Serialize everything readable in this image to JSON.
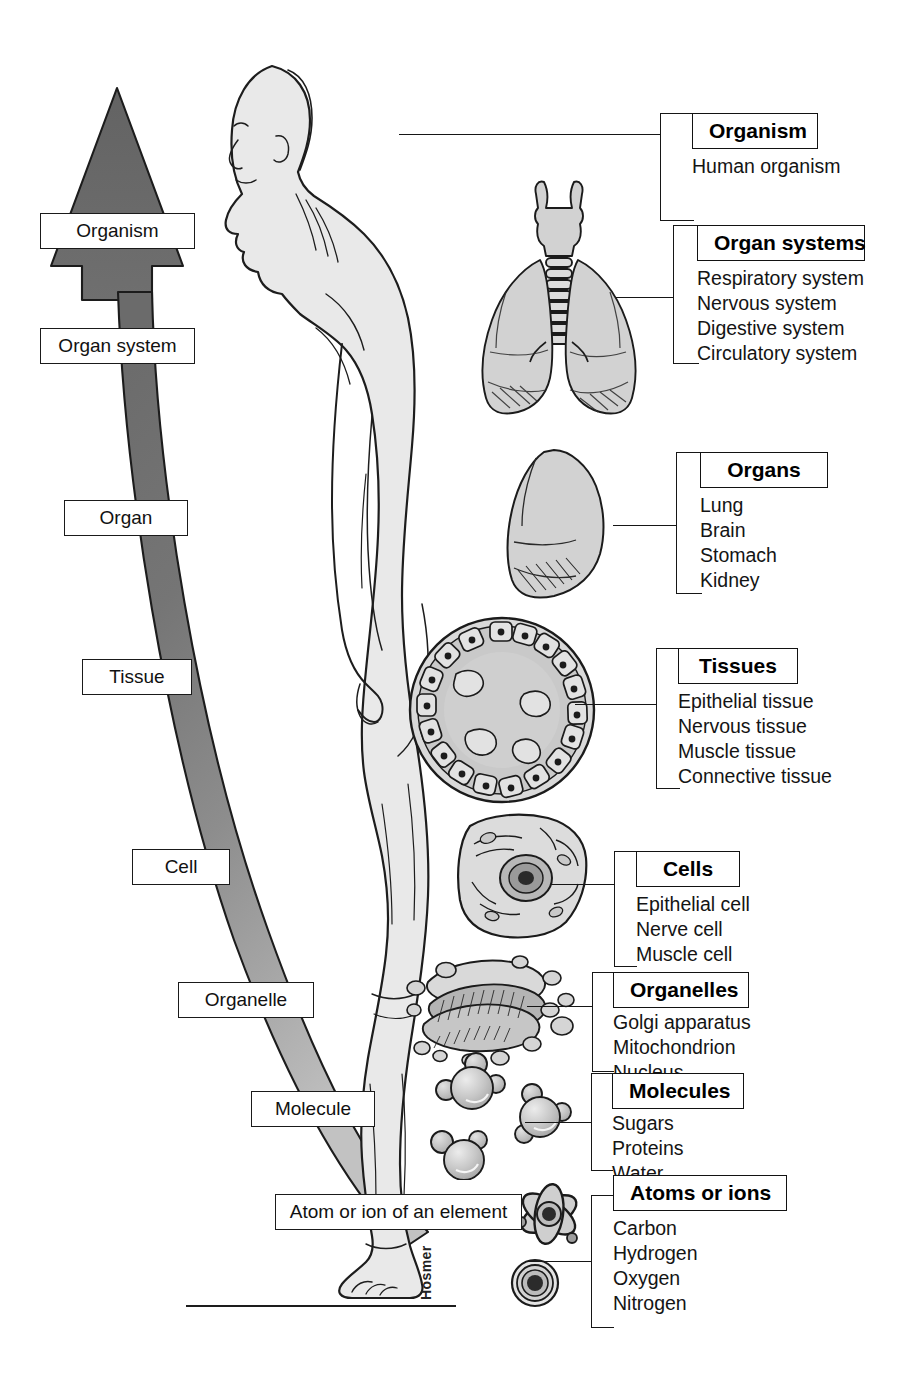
{
  "signature": "Hosmer",
  "hierarchy_arrow": {
    "direction": "up",
    "description": "tapering ribbon widening upward into an arrowhead",
    "levels": [
      {
        "label": "Organism",
        "x": 40,
        "y": 213,
        "w": 155,
        "h": 38
      },
      {
        "label": "Organ system",
        "x": 40,
        "y": 328,
        "w": 155,
        "h": 38
      },
      {
        "label": "Organ",
        "x": 64,
        "y": 500,
        "w": 124,
        "h": 36
      },
      {
        "label": "Tissue",
        "x": 82,
        "y": 659,
        "w": 110,
        "h": 36
      },
      {
        "label": "Cell",
        "x": 132,
        "y": 849,
        "w": 98,
        "h": 36
      },
      {
        "label": "Organelle",
        "x": 178,
        "y": 982,
        "w": 136,
        "h": 36
      },
      {
        "label": "Molecule",
        "x": 251,
        "y": 1091,
        "w": 124,
        "h": 36
      },
      {
        "label": "Atom or ion of an element",
        "x": 275,
        "y": 1194,
        "w": 247,
        "h": 38
      }
    ]
  },
  "callouts": [
    {
      "id": "organism",
      "category": "Organism",
      "items": [
        "Human organism"
      ],
      "box_x": 692,
      "box_y": 113,
      "bracket_x": 660,
      "bracket_y": 113,
      "bracket_h": 108,
      "tick_w": 34,
      "leader_x": 399,
      "leader_y": 134,
      "leader_w": 262,
      "cat_w": 126
    },
    {
      "id": "organ-systems",
      "category": "Organ systems",
      "items": [
        "Respiratory system",
        "Nervous system",
        "Digestive system",
        "Circulatory system"
      ],
      "box_x": 697,
      "box_y": 225,
      "bracket_x": 673,
      "bracket_y": 225,
      "bracket_h": 139,
      "tick_w": 26,
      "leader_x": 616,
      "leader_y": 297,
      "leader_w": 58,
      "cat_w": 168
    },
    {
      "id": "organs",
      "category": "Organs",
      "items": [
        "Lung",
        "Brain",
        "Stomach",
        "Kidney"
      ],
      "box_x": 700,
      "box_y": 452,
      "bracket_x": 676,
      "bracket_y": 452,
      "bracket_h": 142,
      "tick_w": 26,
      "leader_x": 613,
      "leader_y": 525,
      "leader_w": 64,
      "cat_w": 128
    },
    {
      "id": "tissues",
      "category": "Tissues",
      "items": [
        "Epithelial tissue",
        "Nervous tissue",
        "Muscle tissue",
        "Connective tissue"
      ],
      "box_x": 678,
      "box_y": 648,
      "bracket_x": 656,
      "bracket_y": 648,
      "bracket_h": 141,
      "tick_w": 24,
      "leader_x": 575,
      "leader_y": 704,
      "leader_w": 82,
      "cat_w": 120
    },
    {
      "id": "cells",
      "category": "Cells",
      "items": [
        "Epithelial cell",
        "Nerve cell",
        "Muscle cell"
      ],
      "box_x": 636,
      "box_y": 851,
      "bracket_x": 614,
      "bracket_y": 851,
      "bracket_h": 116,
      "tick_w": 23,
      "leader_x": 551,
      "leader_y": 884,
      "leader_w": 64,
      "cat_w": 104
    },
    {
      "id": "organelles",
      "category": "Organelles",
      "items": [
        "Golgi apparatus",
        "Mitochondrion",
        "Nucleus"
      ],
      "box_x": 613,
      "box_y": 972,
      "bracket_x": 592,
      "bracket_y": 972,
      "bracket_h": 100,
      "tick_w": 22,
      "leader_x": 527,
      "leader_y": 1006,
      "leader_w": 66,
      "cat_w": 136
    },
    {
      "id": "molecules",
      "category": "Molecules",
      "items": [
        "Sugars",
        "Proteins",
        "Water"
      ],
      "box_x": 612,
      "box_y": 1073,
      "bracket_x": 591,
      "bracket_y": 1073,
      "bracket_h": 98,
      "tick_w": 22,
      "leader_x": 525,
      "leader_y": 1122,
      "leader_w": 67,
      "cat_w": 132
    },
    {
      "id": "atoms-or-ions",
      "category": "Atoms or ions",
      "items": [
        "Carbon",
        "Hydrogen",
        "Oxygen",
        "Nitrogen"
      ],
      "box_x": 613,
      "box_y": 1175,
      "bracket_x": 591,
      "bracket_y": 1195,
      "bracket_h": 133,
      "tick_w": 23,
      "leader_x": 527,
      "leader_y": 1261,
      "leader_w": 65,
      "cat_w": 174
    }
  ],
  "illustrations": [
    {
      "name": "human-body-figure",
      "label": "Human organism (lateral view, male)"
    },
    {
      "name": "respiratory-system-art",
      "label": "Larynx, trachea and lungs"
    },
    {
      "name": "lung-organ-art",
      "label": "Single lung"
    },
    {
      "name": "tissue-cross-section-art",
      "label": "Circular tissue cross-section with epithelial cells"
    },
    {
      "name": "cell-art",
      "label": "Single cell with nucleus"
    },
    {
      "name": "organelle-art",
      "label": "Golgi apparatus with vesicles"
    },
    {
      "name": "molecule-art",
      "label": "Three ball-and-stick water molecules"
    },
    {
      "name": "atom-art",
      "label": "Atom with orbital shells"
    },
    {
      "name": "ion-art",
      "label": "Ion shown as concentric shells"
    }
  ],
  "colors": {
    "ink": "#161616",
    "ribbon_dark": "#6e6e6e",
    "ribbon_light": "#b8b8b8",
    "art_fill": "#d5d5d5",
    "art_fill_light": "#e6e6e6",
    "paper": "#ffffff"
  }
}
